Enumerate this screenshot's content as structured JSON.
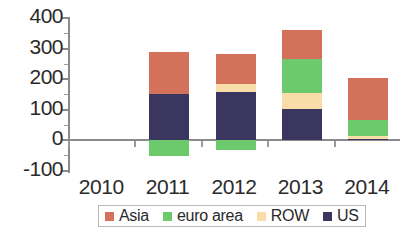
{
  "chart_data": {
    "type": "bar",
    "subtype": "stacked-bar-with-negatives",
    "title": "",
    "subtitle": "",
    "xlabel": "",
    "ylabel": "",
    "categories": [
      "2010",
      "2011",
      "2012",
      "2013",
      "2014"
    ],
    "ylim": [
      -100,
      400
    ],
    "yticks": [
      -100,
      0,
      100,
      200,
      300,
      400
    ],
    "ytick_labels": [
      "-100",
      "0",
      "100",
      "200",
      "300",
      "400"
    ],
    "minor_ticks": true,
    "grid": false,
    "legend_position": "bottom",
    "stack_order_bottom_to_top": [
      "US",
      "ROW",
      "euro area",
      "Asia"
    ],
    "series": [
      {
        "name": "Asia",
        "color": "#d4715b",
        "values": [
          137,
          98,
          95,
          138,
          44
        ]
      },
      {
        "name": "euro area",
        "color": "#6cc96c",
        "values": [
          -52,
          -33,
          112,
          52,
          -47
        ]
      },
      {
        "name": "ROW",
        "color": "#f9dda8",
        "values": [
          0,
          25,
          50,
          10,
          0
        ]
      },
      {
        "name": "US",
        "color": "#3a3660",
        "values": [
          150,
          158,
          103,
          3,
          27
        ]
      }
    ],
    "totals_positive": [
      287,
      281,
      360,
      203,
      71
    ],
    "totals_negative": [
      -52,
      -33,
      0,
      0,
      -47
    ]
  },
  "legend": {
    "items": [
      {
        "label": "Asia",
        "color": "#d4715b"
      },
      {
        "label": "euro area",
        "color": "#6cc96c"
      },
      {
        "label": "ROW",
        "color": "#f9dda8"
      },
      {
        "label": "US",
        "color": "#3a3660"
      }
    ]
  },
  "axis": {
    "y_labels": [
      "400",
      "300",
      "200",
      "100",
      "0",
      "-100"
    ],
    "x_labels": [
      "2010",
      "2011",
      "2012",
      "2013",
      "2014"
    ]
  }
}
